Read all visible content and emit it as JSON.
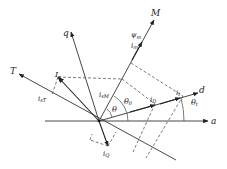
{
  "diagram": {
    "title": "",
    "axes": {
      "a": "a",
      "d": "d",
      "q": "q",
      "M": "M",
      "T": "T"
    },
    "vectors": {
      "Is": "I",
      "Is_sub": "s",
      "It": "i",
      "It_sub": "t",
      "iD": "i",
      "iD_sub": "D",
      "iQ": "i",
      "iQ_sub": "Q",
      "psi_m": "ψ",
      "psi_m_sub": "m",
      "im": "i",
      "im_sub": "m"
    },
    "components": {
      "isM": "i",
      "isM_sub": "sM",
      "isT": "i",
      "isT_sub": "sT"
    },
    "angles": {
      "theta": "θ",
      "theta0": "θ",
      "theta0_sub": "0",
      "thetat": "θ",
      "thetat_sub": "t"
    },
    "colors": {
      "line": "#333333",
      "background": "#ffffff"
    }
  }
}
